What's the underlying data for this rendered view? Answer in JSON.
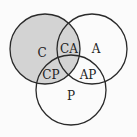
{
  "diagram": {
    "type": "venn",
    "colors": {
      "background": "#fbfbfb",
      "shaded_fill": "#d3d3d3",
      "stroke": "#2a2a2a"
    },
    "circles": [
      {
        "id": "C",
        "cx": 45,
        "cy": 49,
        "r": 35,
        "shaded": true
      },
      {
        "id": "A",
        "cx": 92,
        "cy": 49,
        "r": 35,
        "shaded": false
      },
      {
        "id": "P",
        "cx": 71,
        "cy": 90,
        "r": 35,
        "shaded": false
      }
    ],
    "labels": {
      "c": "C",
      "ca": "CA",
      "a": "A",
      "cp": "CP",
      "ap": "AP",
      "p": "P"
    }
  }
}
